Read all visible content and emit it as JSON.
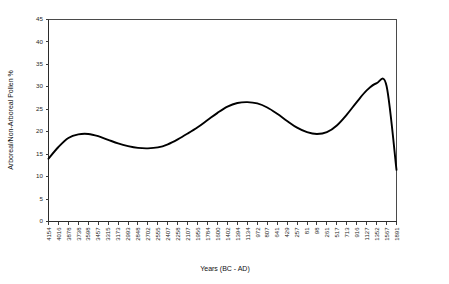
{
  "chart_data": {
    "type": "line",
    "title": "",
    "xlabel": "Years (BC - AD)",
    "ylabel": "Arboreal/Non-Arboreal Pollen %",
    "ylim": [
      0,
      45
    ],
    "yticks": [
      0,
      5,
      10,
      15,
      20,
      25,
      30,
      35,
      40,
      45
    ],
    "grid": false,
    "legend": false,
    "categories": [
      "4154",
      "4016",
      "3878",
      "3738",
      "3598",
      "3457",
      "3315",
      "3173",
      "2993",
      "2848",
      "2702",
      "2555",
      "2407",
      "2258",
      "2107",
      "1956",
      "1784",
      "1600",
      "1402",
      "1394",
      "1134",
      "972",
      "807",
      "641",
      "429",
      "257",
      "81",
      "98",
      "261",
      "517",
      "713",
      "916",
      "1127",
      "1352",
      "1567",
      "1891"
    ],
    "values": [
      14.0,
      16.6,
      18.6,
      19.4,
      19.5,
      19.0,
      18.2,
      17.4,
      16.8,
      16.4,
      16.3,
      16.5,
      17.2,
      18.3,
      19.6,
      21.0,
      22.6,
      24.2,
      25.6,
      26.4,
      26.6,
      26.3,
      25.4,
      24.0,
      22.4,
      20.9,
      19.9,
      19.5,
      19.9,
      21.4,
      23.8,
      26.6,
      29.2,
      30.8,
      30.2,
      11.5
    ]
  },
  "axes": {
    "y_axis_title": "Arboreal/Non-Arboreal Pollen %",
    "x_axis_title": "Years (BC - AD)"
  }
}
